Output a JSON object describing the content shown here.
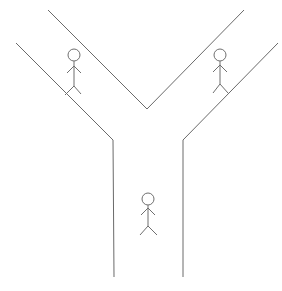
{
  "diagram": {
    "type": "y-junction-road-with-pedestrians",
    "background_color": "#ffffff",
    "line_color": "#6a6a6a",
    "roads": [
      {
        "name": "left-branch",
        "direction": "upper-left"
      },
      {
        "name": "right-branch",
        "direction": "upper-right"
      },
      {
        "name": "stem",
        "direction": "down"
      }
    ],
    "pedestrians": [
      {
        "name": "pedestrian-left-branch",
        "location": "left-branch",
        "head": [
          74,
          55
        ]
      },
      {
        "name": "pedestrian-right-branch",
        "location": "right-branch",
        "head": [
          220,
          55
        ]
      },
      {
        "name": "pedestrian-stem",
        "location": "stem",
        "head": [
          148,
          199
        ]
      }
    ]
  }
}
